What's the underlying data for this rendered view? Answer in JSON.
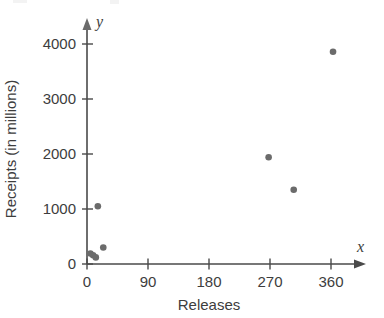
{
  "chart_data": {
    "type": "scatter",
    "title": "",
    "xlabel": "Releases",
    "ylabel": "Receipts (in millions)",
    "x_axis_symbol": "x",
    "y_axis_symbol": "y",
    "xlim": [
      0,
      405
    ],
    "ylim": [
      0,
      4400
    ],
    "xticks": [
      0,
      90,
      180,
      270,
      360
    ],
    "xtick_labels": [
      "0",
      "90",
      "180",
      "270",
      "360"
    ],
    "yticks": [
      0,
      1000,
      2000,
      3000,
      4000
    ],
    "ytick_labels": [
      "0",
      "1000",
      "2000",
      "3000",
      "4000"
    ],
    "grid": false,
    "legend": false,
    "marker_color": "#6b6b6b",
    "axis_color": "#4a4a4a",
    "points": [
      {
        "x": 5,
        "y": 190
      },
      {
        "x": 9,
        "y": 160
      },
      {
        "x": 13,
        "y": 120
      },
      {
        "x": 16,
        "y": 1050
      },
      {
        "x": 24,
        "y": 300
      },
      {
        "x": 268,
        "y": 1940
      },
      {
        "x": 305,
        "y": 1350
      },
      {
        "x": 363,
        "y": 3860
      }
    ]
  }
}
